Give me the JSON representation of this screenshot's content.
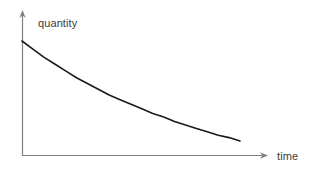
{
  "figure": {
    "background_color": "#ffffff",
    "width": 316,
    "height": 172
  },
  "axes": {
    "y_axis": {
      "label": "quantity",
      "color": "#808080",
      "arrow": "arrow-up"
    },
    "x_axis": {
      "label": "time",
      "color": "#808080",
      "arrow": "arrow-right"
    }
  },
  "curve": {
    "color": "#1a1a1a",
    "stroke_width": 1.6
  },
  "chart_data": {
    "type": "line",
    "title": "",
    "subtitle": "",
    "xlabel": "time",
    "ylabel": "quantity",
    "grid": false,
    "legend": null,
    "xlim": [
      0,
      1
    ],
    "ylim": [
      0,
      1
    ],
    "x_tick_labels": [],
    "y_tick_labels": [],
    "annotations": [],
    "series": [
      {
        "name": "quantity",
        "description": "exponential decay of quantity over time",
        "x": [
          0.0,
          0.05,
          0.1,
          0.15,
          0.2,
          0.25,
          0.3,
          0.35,
          0.4,
          0.45,
          0.5,
          0.55,
          0.6,
          0.65,
          0.7,
          0.75,
          0.8,
          0.85,
          0.9,
          0.95,
          1.0
        ],
        "y": [
          1.0,
          0.93,
          0.86,
          0.8,
          0.74,
          0.68,
          0.63,
          0.58,
          0.53,
          0.49,
          0.45,
          0.41,
          0.37,
          0.34,
          0.3,
          0.27,
          0.24,
          0.21,
          0.18,
          0.16,
          0.13
        ]
      }
    ]
  }
}
